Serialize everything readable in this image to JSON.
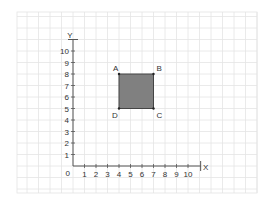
{
  "diagram": {
    "type": "coordinate-grid",
    "axes": {
      "x_label": "X",
      "y_label": "Y",
      "origin_label": "0",
      "x_ticks": [
        "1",
        "2",
        "3",
        "4",
        "5",
        "6",
        "7",
        "8",
        "9",
        "10"
      ],
      "y_ticks": [
        "1",
        "2",
        "3",
        "4",
        "5",
        "6",
        "7",
        "8",
        "9",
        "10"
      ]
    },
    "shape": {
      "name": "square ABCD",
      "fill": "#808080",
      "stroke": "#444444",
      "vertices": [
        {
          "label": "A",
          "x": 4,
          "y": 8
        },
        {
          "label": "B",
          "x": 7,
          "y": 8
        },
        {
          "label": "C",
          "x": 7,
          "y": 5
        },
        {
          "label": "D",
          "x": 4,
          "y": 5
        }
      ]
    },
    "colors": {
      "grid": "#e4e4e4",
      "axis": "#555555",
      "text": "#333333"
    }
  }
}
